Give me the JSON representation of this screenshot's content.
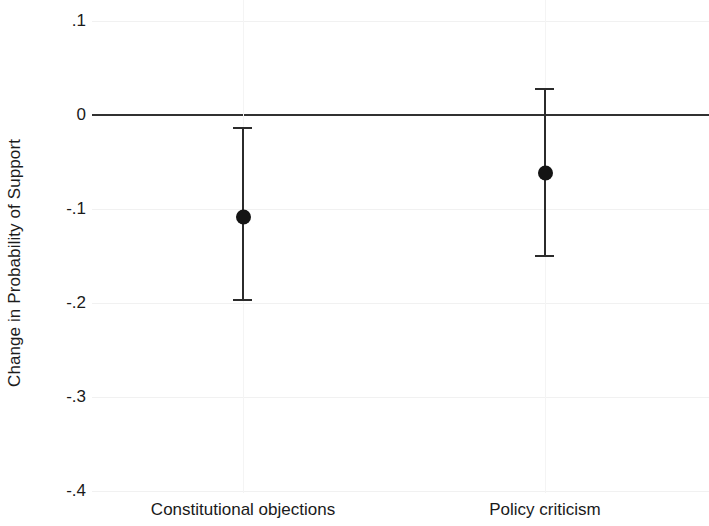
{
  "chart_data": {
    "type": "scatter",
    "title": "",
    "subtitle": "",
    "xlabel": "",
    "ylabel": "Change in Probability of Support",
    "categories": [
      "Constitutional objections",
      "Policy criticism"
    ],
    "values": [
      -0.109,
      -0.062
    ],
    "ci_low": [
      -0.198,
      -0.151
    ],
    "ci_high": [
      -0.013,
      0.029
    ],
    "ylim": [
      -0.4,
      0.1
    ],
    "yticks": [
      0.1,
      0,
      -0.1,
      -0.2,
      -0.3,
      -0.4
    ],
    "ytick_labels": [
      ".1",
      "0",
      "-.1",
      "-.2",
      "-.3",
      "-.4"
    ],
    "grid": true,
    "legend": false,
    "reference_line": 0,
    "series": [
      {
        "name": "Change in Probability of Support",
        "points": [
          {
            "category": "Constitutional objections",
            "estimate": -0.109,
            "ci_low": -0.198,
            "ci_high": -0.013
          },
          {
            "category": "Policy criticism",
            "estimate": -0.062,
            "ci_low": -0.151,
            "ci_high": 0.029
          }
        ]
      }
    ]
  },
  "axis": {
    "y_title": "Change in Probability of Support",
    "ticks": [
      {
        "label": ".1",
        "value": 0.1
      },
      {
        "label": "0",
        "value": 0.0
      },
      {
        "label": "-.1",
        "value": -0.1
      },
      {
        "label": "-.2",
        "value": -0.2
      },
      {
        "label": "-.3",
        "value": -0.3
      },
      {
        "label": "-.4",
        "value": -0.4
      }
    ]
  },
  "categories": [
    {
      "label": "Constitutional objections"
    },
    {
      "label": "Policy criticism"
    }
  ],
  "colors": {
    "marker": "#141414",
    "ci": "#2b2b2b",
    "zero_line": "#313131",
    "grid": "#f1f1f1",
    "background": "#ffffff",
    "text": "#1a1a1a"
  }
}
